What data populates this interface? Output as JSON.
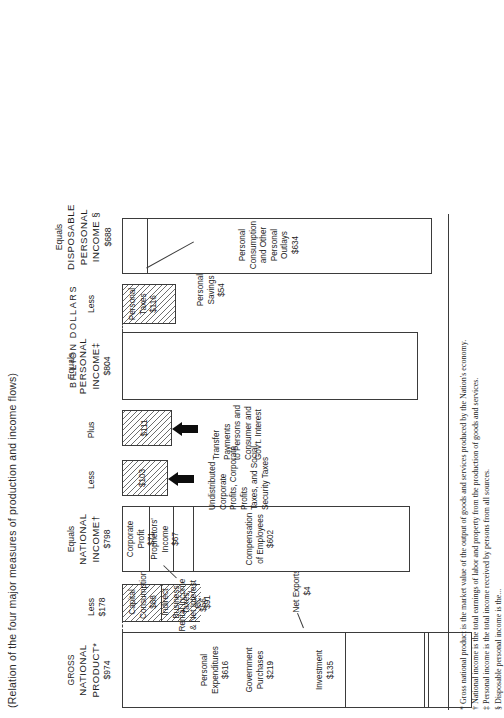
{
  "title": "(Relation of the four major measures of production and income flows)",
  "units_label": "BILLION DOLLARS",
  "columns": {
    "gnp": {
      "heading_pre": "GROSS",
      "heading_main": "NATIONAL",
      "heading_main2": "PRODUCT*",
      "amount": "$974",
      "items": [
        {
          "label": "Personal\nExpenditures",
          "amount": "$616"
        },
        {
          "label": "Government\nPurchases",
          "amount": "$219"
        },
        {
          "label": "Net Exports",
          "amount": "$4"
        },
        {
          "label": "Investment",
          "amount": "$135"
        }
      ]
    },
    "less_gnp": {
      "connector": "Less",
      "amount": "$178",
      "items": [
        {
          "label": "Indirect\nBusiness\nTaxes, etc.",
          "amount": "$91"
        },
        {
          "label": "Capital\nConsumption",
          "amount": "$88"
        }
      ]
    },
    "ni": {
      "heading_pre": "Equals",
      "heading_main": "NATIONAL",
      "heading_main2": "INCOME†",
      "amount": "$798",
      "items": [
        {
          "label": "Compensation\nof Employees",
          "amount": "$602"
        },
        {
          "label": "Proprietors'\nIncome",
          "amount": "$67"
        },
        {
          "label": "Corporate\nProfit",
          "amount": "$71"
        },
        {
          "label": "Rental Income\n& Net Interest",
          "amount": "$56"
        }
      ]
    },
    "less_ni": {
      "connector": "Less",
      "amount": "$103",
      "annotation": "Undistributed Corporate\nProfits, Corporate Profits\nTaxes, and Social\nSecurity Taxes"
    },
    "plus_ni": {
      "connector": "Plus",
      "amount": "$111",
      "annotation": "Transfer Payments\nto Persons and\nConsumer and\nGov't. Interest"
    },
    "pi": {
      "heading_pre": "Equals",
      "heading_main": "PERSONAL",
      "heading_main2": "INCOME‡",
      "amount": "$804"
    },
    "less_pi": {
      "connector": "Less",
      "label": "Personal\nTaxes",
      "amount": "$116"
    },
    "dpi": {
      "heading_pre": "Equals",
      "heading_main": "DISPOSABLE",
      "heading_main2": "PERSONAL",
      "heading_main3": "INCOME §",
      "amount": "$688",
      "items": [
        {
          "label": "Personal\nConsumption\nand Other\nPersonal\nOutlays",
          "amount": "$634"
        },
        {
          "label": "Personal\nSavings",
          "amount": "$54"
        }
      ]
    }
  },
  "footnotes": [
    "* Gross national product is the market value of the output of goods and services produced by the Nation's economy.",
    "† National income is the total earnings of labor and property from the production of goods and services.",
    "‡ Personal income is the total income received by persons from all sources.",
    "§ Disposable personal income is the..."
  ]
}
